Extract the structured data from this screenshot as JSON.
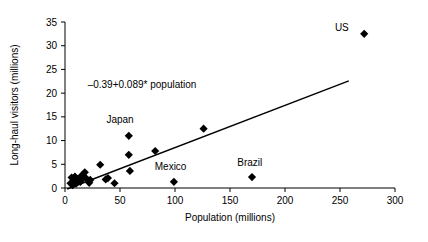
{
  "chart_data": {
    "type": "scatter",
    "title": "",
    "xlabel": "Population (millions)",
    "ylabel": "Long-haul visitors (millions)",
    "xlim": [
      0,
      300
    ],
    "ylim": [
      0,
      35
    ],
    "xticks": [
      0,
      50,
      100,
      150,
      200,
      250,
      300
    ],
    "yticks": [
      0,
      5,
      10,
      15,
      20,
      25,
      30,
      35
    ],
    "grid": false,
    "legend": null,
    "annotations": [
      {
        "name": "regression-equation",
        "text": "–0.39+0.089* population",
        "x": 70,
        "y": 21
      }
    ],
    "trendline": {
      "type": "linear",
      "intercept": -0.39,
      "slope": 0.089,
      "x_start": 2,
      "x_end": 258,
      "equation_text": "–0.39+0.089* population"
    },
    "points": [
      {
        "x": 5,
        "y": 1.0,
        "label": ""
      },
      {
        "x": 6,
        "y": 2.2,
        "label": ""
      },
      {
        "x": 7,
        "y": 0.6,
        "label": ""
      },
      {
        "x": 8,
        "y": 1.6,
        "label": ""
      },
      {
        "x": 9,
        "y": 2.4,
        "label": ""
      },
      {
        "x": 10,
        "y": 0.9,
        "label": ""
      },
      {
        "x": 11,
        "y": 1.9,
        "label": ""
      },
      {
        "x": 14,
        "y": 1.3,
        "label": ""
      },
      {
        "x": 15,
        "y": 2.6,
        "label": ""
      },
      {
        "x": 16,
        "y": 2.0,
        "label": ""
      },
      {
        "x": 18,
        "y": 3.3,
        "label": ""
      },
      {
        "x": 19,
        "y": 2.1,
        "label": ""
      },
      {
        "x": 22,
        "y": 1.1,
        "label": ""
      },
      {
        "x": 23,
        "y": 1.7,
        "label": ""
      },
      {
        "x": 32,
        "y": 4.9,
        "label": ""
      },
      {
        "x": 37,
        "y": 1.8,
        "label": ""
      },
      {
        "x": 39,
        "y": 2.1,
        "label": ""
      },
      {
        "x": 45,
        "y": 1.0,
        "label": ""
      },
      {
        "x": 58,
        "y": 11.0,
        "label": "Japan"
      },
      {
        "x": 58,
        "y": 7.0,
        "label": ""
      },
      {
        "x": 59,
        "y": 3.6,
        "label": ""
      },
      {
        "x": 82,
        "y": 7.8,
        "label": ""
      },
      {
        "x": 99,
        "y": 1.3,
        "label": "Mexico"
      },
      {
        "x": 126,
        "y": 12.5,
        "label": ""
      },
      {
        "x": 170,
        "y": 2.3,
        "label": "Brazil"
      },
      {
        "x": 272,
        "y": 32.5,
        "label": "US"
      }
    ],
    "point_labels": [
      {
        "name": "label-japan",
        "text": "Japan",
        "x": 50,
        "y": 13.6,
        "anchor": "middle"
      },
      {
        "name": "label-mexico",
        "text": "Mexico",
        "x": 96,
        "y": 3.7,
        "anchor": "middle"
      },
      {
        "name": "label-brazil",
        "text": "Brazil",
        "x": 168,
        "y": 4.6,
        "anchor": "middle"
      },
      {
        "name": "label-us",
        "text": "US",
        "x": 258,
        "y": 33.2,
        "anchor": "end"
      }
    ],
    "colors": {
      "marker": "#000000",
      "line": "#000000",
      "axis": "#000000",
      "background": "#ffffff"
    }
  }
}
